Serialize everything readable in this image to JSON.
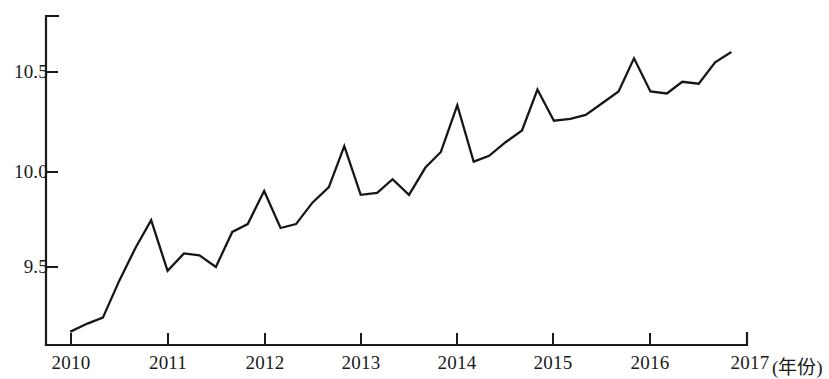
{
  "chart_data": {
    "type": "line",
    "title": "",
    "subtitle": "",
    "xlabel": "(年份)",
    "ylabel": "",
    "grid": false,
    "legend": null,
    "xlim": [
      2010,
      2017
    ],
    "ylim": [
      9.12,
      10.82
    ],
    "x_tick_labels": [
      "2010",
      "2011",
      "2012",
      "2013",
      "2014",
      "2015",
      "2016",
      "2017"
    ],
    "x_tick_values": [
      2010,
      2011,
      2012,
      2013,
      2014,
      2015,
      2016,
      2017
    ],
    "y_tick_labels": [
      "9.5",
      "10.0",
      "10.5"
    ],
    "y_tick_values": [
      9.5,
      10.0,
      10.5
    ],
    "x_unit_note": "(年份)",
    "frequency": "quarterly",
    "series": [
      {
        "name": "",
        "color": "#17171a",
        "x": [
          2010.0,
          2010.25,
          2010.5,
          2010.75,
          2011.0,
          2011.25,
          2011.5,
          2011.75,
          2012.0,
          2012.25,
          2012.5,
          2012.75,
          2013.0,
          2013.25,
          2013.5,
          2013.75,
          2014.0,
          2014.25,
          2014.5,
          2014.75,
          2015.0,
          2015.25,
          2015.5,
          2015.75,
          2016.0,
          2016.25,
          2016.5,
          2016.75
        ],
        "values": [
          9.17,
          9.21,
          9.24,
          9.43,
          9.6,
          9.74,
          9.48,
          9.57,
          9.56,
          9.5,
          9.68,
          9.72,
          9.89,
          9.7,
          9.72,
          9.83,
          9.91,
          10.12,
          9.87,
          9.88,
          9.95,
          9.87,
          10.01,
          10.09,
          10.33,
          10.04,
          10.07,
          10.14
        ]
      }
    ],
    "values_full": [
      9.17,
      9.21,
      9.24,
      9.43,
      9.6,
      9.74,
      9.48,
      9.57,
      9.56,
      9.5,
      9.68,
      9.72,
      9.89,
      9.7,
      9.72,
      9.83,
      9.91,
      10.12,
      9.87,
      9.88,
      9.95,
      9.87,
      10.01,
      10.09,
      10.33,
      10.04,
      10.07,
      10.14,
      10.2,
      10.41,
      10.25,
      10.26,
      10.28,
      10.34,
      10.4,
      10.57,
      10.4,
      10.39,
      10.45,
      10.44,
      10.55,
      10.6,
      10.68,
      10.77
    ],
    "x_full": [
      2010.0,
      2010.17,
      2010.33,
      2010.5,
      2010.67,
      2010.83,
      2011.0,
      2011.17,
      2011.33,
      2011.5,
      2011.67,
      2011.83,
      2012.0,
      2012.17,
      2012.33,
      2012.5,
      2012.67,
      2012.83,
      2013.0,
      2013.17,
      2013.33,
      2013.5,
      2013.67,
      2013.83,
      2014.0,
      2014.17,
      2014.33,
      2014.5,
      2014.67,
      2014.83,
      2015.0,
      2015.17,
      2015.33,
      2015.5,
      2015.67,
      2015.83,
      2016.0,
      2016.17,
      2016.33,
      2016.5,
      2016.67,
      2016.83
    ]
  },
  "axes": {
    "x_labels": [
      "2010",
      "2011",
      "2012",
      "2013",
      "2014",
      "2015",
      "2016",
      "2017"
    ],
    "y_labels": [
      "10.5",
      "10.0",
      "9.5"
    ],
    "x_unit": "(年份)"
  }
}
